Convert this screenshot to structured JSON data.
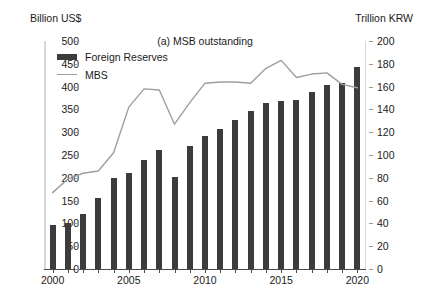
{
  "chart_data": {
    "type": "bar",
    "title": "(a) MSB outstanding",
    "xlabel": "",
    "ylabel": "Billion US$",
    "y2label": "Trillion KRW",
    "ylim": [
      0,
      500
    ],
    "y2lim": [
      0,
      200
    ],
    "yticks": [
      0,
      50,
      100,
      150,
      200,
      250,
      300,
      350,
      400,
      450,
      500
    ],
    "y2ticks": [
      0,
      20,
      40,
      60,
      80,
      100,
      120,
      140,
      160,
      180,
      200
    ],
    "grid": false,
    "legend_position": "upper-left",
    "categories": [
      "2000",
      "2001",
      "2002",
      "2003",
      "2004",
      "2005",
      "2006",
      "2007",
      "2008",
      "2009",
      "2010",
      "2011",
      "2012",
      "2013",
      "2014",
      "2015",
      "2016",
      "2017",
      "2018",
      "2019",
      "2020"
    ],
    "xtick_labels": [
      "2000",
      "2005",
      "2010",
      "2015",
      "2020"
    ],
    "series": [
      {
        "name": "Foreign Reserves",
        "type": "bar",
        "axis": "left",
        "unit": "Billion US$",
        "color": "#3c3c3c",
        "values": [
          96,
          102,
          121,
          155,
          199,
          210,
          239,
          262,
          201,
          270,
          292,
          307,
          327,
          346,
          363,
          368,
          371,
          389,
          403,
          409,
          443
        ]
      },
      {
        "name": "MBS",
        "type": "line",
        "axis": "right",
        "unit": "Trillion KRW",
        "color": "#9e9e9e",
        "values": [
          67,
          79,
          84,
          86,
          102,
          142,
          158,
          157,
          127,
          146,
          163,
          164,
          164,
          163,
          176,
          183,
          168,
          171,
          172,
          162,
          159
        ]
      }
    ]
  },
  "legend": {
    "items": [
      {
        "label": "Foreign Reserves",
        "marker": "bar-swatch"
      },
      {
        "label": "MBS",
        "marker": "line-swatch"
      }
    ]
  }
}
